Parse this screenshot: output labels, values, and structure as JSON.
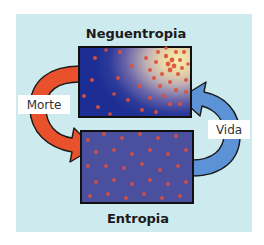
{
  "diagram": {
    "top_state": {
      "title": "Neguentropia",
      "description": "ordered state: particles clustered in upper-right bright region of gradient box"
    },
    "bottom_state": {
      "title": "Entropia",
      "description": "disordered state: particles evenly scattered on uniform purple-blue box"
    },
    "arrows": [
      {
        "label": "Morte",
        "from": "Neguentropia",
        "to": "Entropia",
        "side": "left",
        "color": "#e8512c"
      },
      {
        "label": "Vida",
        "from": "Entropia",
        "to": "Neguentropia",
        "side": "right",
        "color": "#5b93d6"
      }
    ],
    "colors": {
      "panel_background": "#cdeaee",
      "box_border": "#111111",
      "particle": "#e0503a",
      "entropy_box_fill": "#4a4f9e",
      "negentropy_gradient_dark": "#1c2e93",
      "negentropy_gradient_light": "#f7eeb0"
    }
  }
}
